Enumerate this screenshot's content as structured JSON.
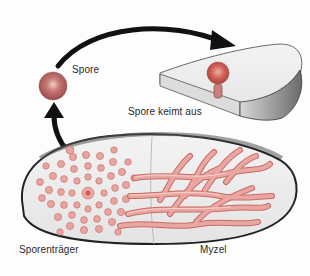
{
  "diagram": {
    "labels": {
      "spore": "Spore",
      "spore_germinates": "Spore keimt aus",
      "sporangiophore": "Sporenträger",
      "mycelium": "Myzel"
    },
    "colors": {
      "spore_fill": "#b85a5a",
      "hyphae_fill": "#e6a09a",
      "hyphae_stroke": "#c86a66",
      "substrate_fill": "#ececec",
      "outline": "#1f1f1f",
      "arrow": "#111111",
      "label_text": "#2a2a2a"
    },
    "arrows": [
      {
        "from": "spore",
        "to": "spore_germinates",
        "shape": "arc"
      },
      {
        "from": "sporangiophore",
        "to": "spore",
        "shape": "curve-up"
      }
    ]
  }
}
